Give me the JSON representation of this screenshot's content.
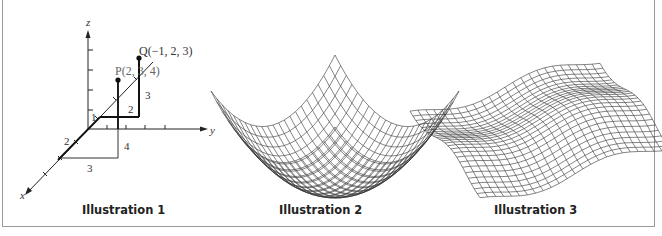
{
  "figure": {
    "illustrations": [
      {
        "caption": "Illustration 1",
        "type": "3d-coordinate-axes",
        "axes": {
          "x": "x",
          "y": "y",
          "z": "z"
        },
        "points": [
          {
            "name": "P",
            "label": "P(2, 3, 4)",
            "coords": [
              2,
              3,
              4
            ]
          },
          {
            "name": "Q",
            "label": "Q(−1, 2, 3)",
            "coords": [
              -1,
              2,
              3
            ]
          }
        ],
        "segment_labels": [
          "3",
          "2",
          "1",
          "2",
          "4",
          "3"
        ]
      },
      {
        "caption": "Illustration 2",
        "type": "wireframe-surface-paraboloid"
      },
      {
        "caption": "Illustration 3",
        "type": "wireframe-surface-wavy"
      }
    ]
  },
  "labels": {
    "z_axis": "z",
    "y_axis": "y",
    "x_axis": "x",
    "point_q": "Q(−1, 2, 3)",
    "point_p": "P(2, 3, 4)",
    "seg_q_height": "3",
    "seg_q_y": "2",
    "seg_q_x": "1",
    "seg_p_x": "2",
    "seg_p_height": "4",
    "seg_p_y": "3"
  },
  "captions": {
    "illustration_1": "Illustration 1",
    "illustration_2": "Illustration 2",
    "illustration_3": "Illustration 3"
  }
}
